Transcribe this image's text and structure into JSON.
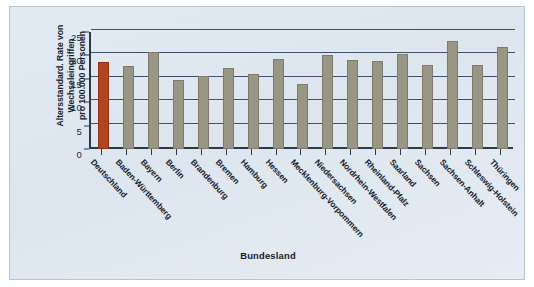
{
  "chart_data": {
    "type": "bar",
    "title": "",
    "xlabel": "Bundesland",
    "ylabel": "Altersstandard. Rate von Wechseleingriffen pro 100.000 Personen",
    "ylabel_lines": [
      "Altersstandard. Rate von",
      "Wechseleingriffen",
      "pro 100.000 Personen"
    ],
    "categories": [
      "Deutschland",
      "Baden-Württemberg",
      "Bayern",
      "Berlin",
      "Brandenburg",
      "Bremen",
      "Hamburg",
      "Hessen",
      "Mecklenburg-Vorpommern",
      "Niedersachsen",
      "Nordrhein-Westfalen",
      "Rheinland-Pfalz",
      "Saarland",
      "Sachsen",
      "Sachsen-Anhalt",
      "Schleswig-Holstein",
      "Thüringen"
    ],
    "values": [
      18.6,
      17.8,
      20.8,
      14.7,
      15.5,
      17.3,
      16.0,
      19.2,
      13.8,
      20.0,
      19.0,
      18.9,
      20.2,
      18.0,
      23.0,
      17.9,
      21.7
    ],
    "highlight_index": 0,
    "ylim": [
      0,
      25
    ],
    "yticks": [
      0,
      5,
      10,
      15,
      20,
      25
    ],
    "ytick_labels": [
      "0",
      "5",
      "10",
      "15",
      "20",
      "25"
    ],
    "grid": true,
    "legend": null,
    "colors": {
      "bar": "#9a9684",
      "highlight_bar": "#b5441e",
      "axis": "#2b3a4a",
      "gridline": "#41506a",
      "background": "#e2eaf2",
      "text": "#16202b"
    }
  }
}
